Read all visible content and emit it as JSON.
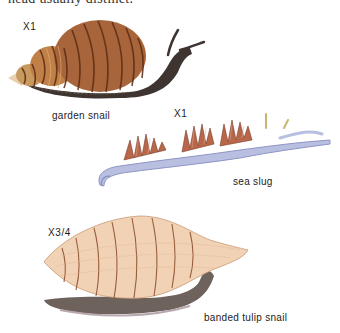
{
  "page": {
    "cut_off_heading": "head usually distinct."
  },
  "figures": [
    {
      "name": "garden snail",
      "scale": "X1"
    },
    {
      "name": "sea slug",
      "scale": "X1"
    },
    {
      "name": "banded tulip snail",
      "scale": "X3/4"
    }
  ],
  "colors": {
    "garden_snail_shell": "#a8643a",
    "garden_snail_stripe": "#5a2c14",
    "garden_snail_body": "#3e3530",
    "sea_slug_body": "#b9bfe0",
    "sea_slug_cerata": "#b8674a",
    "tulip_shell": "#f1d2b4",
    "tulip_band": "#8a4a2a",
    "tulip_body": "#6e625c"
  }
}
